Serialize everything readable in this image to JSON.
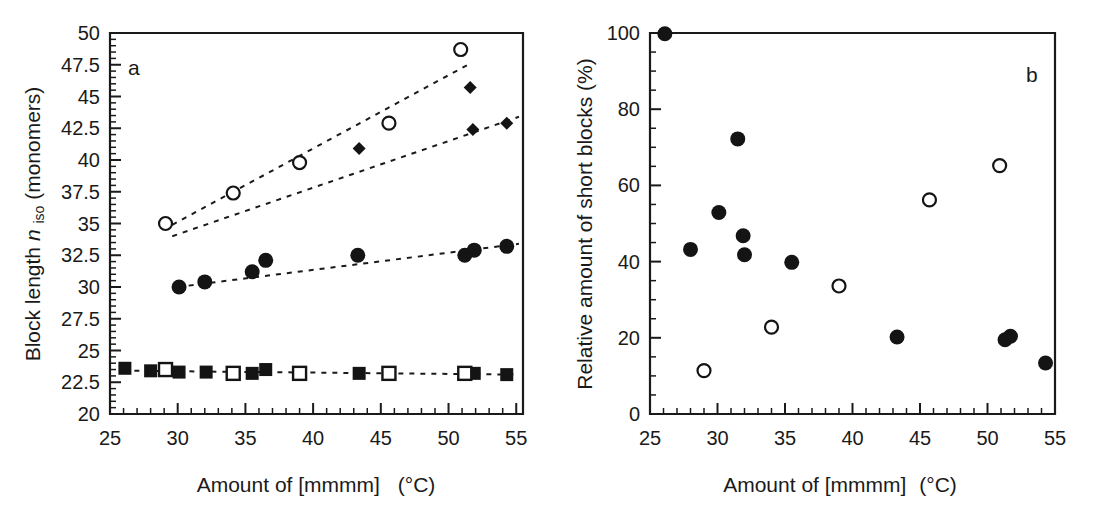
{
  "figure": {
    "background_color": "#ffffff",
    "ink_color": "#141414",
    "panels": [
      "a",
      "b"
    ]
  },
  "panel_a": {
    "letter": "a",
    "xlabel_parts": {
      "main": "Amount of [mmmm]",
      "unit": "(°C)"
    },
    "ylabel_parts": {
      "pre": "Block length ",
      "sym": "n",
      "sub": "iso",
      "post": " (monomers)"
    },
    "xticklabels": [
      "25",
      "30",
      "35",
      "40",
      "45",
      "50",
      "55"
    ],
    "yticklabels": [
      "20",
      "22.5",
      "25",
      "27.5",
      "30",
      "32.5",
      "35",
      "37.5",
      "40",
      "42.5",
      "45",
      "47.5",
      "50"
    ]
  },
  "panel_b": {
    "letter": "b",
    "xlabel_parts": {
      "main": "Amount of [mmmm]",
      "unit": "(°C)"
    },
    "ylabel": "Relative amount of short blocks (%)",
    "xticklabels": [
      "25",
      "30",
      "35",
      "40",
      "45",
      "50",
      "55"
    ],
    "yticklabels": [
      "0",
      "20",
      "40",
      "60",
      "80",
      "100"
    ]
  },
  "chart_data": [
    {
      "type": "scatter",
      "panel": "a",
      "title": "",
      "xlabel": "Amount of [mmmm]  (°C)",
      "ylabel": "Block length n_iso (monomers)",
      "xlim": [
        25,
        55.5
      ],
      "ylim": [
        20,
        50
      ],
      "xticks": [
        25,
        30,
        35,
        40,
        45,
        50,
        55
      ],
      "xminor_step": 1,
      "yticks": [
        20,
        22.5,
        25,
        27.5,
        30,
        32.5,
        35,
        37.5,
        40,
        42.5,
        45,
        47.5,
        50
      ],
      "yminor_step": 0.5,
      "grid": false,
      "legend": "none",
      "series": [
        {
          "name": "open-circle",
          "marker": "circle-open",
          "size": 13,
          "x": [
            29.1,
            34.1,
            39.0,
            45.6,
            50.9
          ],
          "y": [
            35.0,
            37.4,
            39.8,
            42.9,
            48.7
          ],
          "fit": {
            "x": [
              29.6,
              51.6
            ],
            "y": [
              34.9,
              47.6
            ]
          }
        },
        {
          "name": "filled-diamond",
          "marker": "diamond-filled",
          "size": 13,
          "x": [
            43.4,
            51.6,
            51.8,
            54.3
          ],
          "y": [
            40.9,
            45.7,
            42.4,
            42.9
          ],
          "fit": {
            "x": [
              29.6,
              55.2
            ],
            "y": [
              34.0,
              43.4
            ]
          }
        },
        {
          "name": "filled-circle",
          "marker": "circle-filled",
          "size": 15,
          "x": [
            30.1,
            32.0,
            35.5,
            36.5,
            43.3,
            51.2,
            51.9,
            54.3
          ],
          "y": [
            30.0,
            30.4,
            31.2,
            32.1,
            32.5,
            32.5,
            32.9,
            33.2
          ],
          "fit": {
            "x": [
              30.0,
              55.2
            ],
            "y": [
              30.0,
              33.4
            ]
          }
        },
        {
          "name": "filled-square",
          "marker": "square-filled",
          "size": 13,
          "x": [
            26.1,
            28.0,
            30.1,
            32.1,
            35.5,
            36.5,
            43.4,
            51.9,
            54.3
          ],
          "y": [
            23.6,
            23.4,
            23.3,
            23.3,
            23.2,
            23.5,
            23.2,
            23.2,
            23.1
          ]
        },
        {
          "name": "open-square",
          "marker": "square-open",
          "size": 13,
          "x": [
            29.1,
            34.1,
            39.0,
            45.6,
            51.2
          ],
          "y": [
            23.5,
            23.2,
            23.2,
            23.2,
            23.2
          ],
          "fit": {
            "x": [
              26.8,
              55.2
            ],
            "y": [
              23.4,
              23.1
            ]
          }
        }
      ]
    },
    {
      "type": "scatter",
      "panel": "b",
      "title": "",
      "xlabel": "Amount of [mmmm] (°C)",
      "ylabel": "Relative amount of short blocks (%)",
      "xlim": [
        25,
        55
      ],
      "ylim": [
        0,
        100
      ],
      "xticks": [
        25,
        30,
        35,
        40,
        45,
        50,
        55
      ],
      "xminor_step": 1,
      "yticks": [
        0,
        20,
        40,
        60,
        80,
        100
      ],
      "yminor_step": 5,
      "grid": false,
      "legend": "none",
      "series": [
        {
          "name": "filled-circle",
          "marker": "circle-filled",
          "size": 15,
          "x": [
            26.1,
            28.0,
            30.1,
            31.5,
            31.9,
            32.0,
            35.5,
            43.3,
            51.3,
            51.7,
            54.3
          ],
          "y": [
            99.8,
            43.2,
            52.9,
            72.2,
            46.8,
            41.8,
            39.8,
            20.2,
            19.5,
            20.4,
            13.4
          ]
        },
        {
          "name": "open-circle",
          "marker": "circle-open",
          "size": 13,
          "x": [
            29.0,
            34.0,
            39.0,
            45.7,
            50.9
          ],
          "y": [
            11.4,
            22.8,
            33.6,
            56.2,
            65.2
          ]
        }
      ]
    }
  ]
}
